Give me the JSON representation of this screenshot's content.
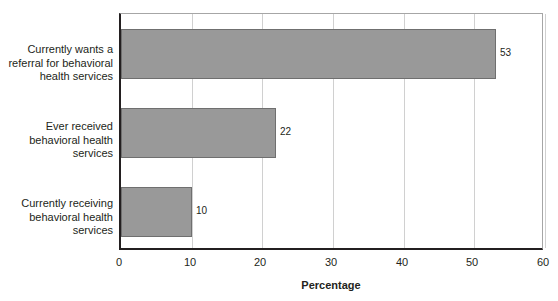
{
  "chart_data": {
    "type": "bar",
    "orientation": "horizontal",
    "title": "",
    "subtitle": "",
    "xlabel": "Percentage",
    "ylabel": "",
    "xlim": [
      0,
      60
    ],
    "xticks": [
      0,
      10,
      20,
      30,
      40,
      50,
      60
    ],
    "xtick_labels": [
      "0",
      "10",
      "20",
      "30",
      "40",
      "50",
      "60"
    ],
    "grid": "vertical",
    "legend": "none",
    "categories": [
      "Currently wants a referral for behavioral health services",
      "Ever received behavioral health services",
      "Currently receiving behavioral health services"
    ],
    "category_label_lines": [
      [
        "Currently wants a",
        "referral for behavioral",
        "health services"
      ],
      [
        "Ever received",
        "behavioral health",
        "services"
      ],
      [
        "Currently receiving",
        "behavioral health",
        "services"
      ]
    ],
    "values": [
      53,
      22,
      10
    ],
    "value_labels": [
      "53",
      "22",
      "10"
    ],
    "colors": {
      "bar_fill": "#999999",
      "bar_edge": "#6f6f6f",
      "axis": "#231f20",
      "grid": "#d0d0d0",
      "plot_border": "#a6a6a6",
      "background": "#ffffff",
      "text": "#231f20"
    }
  }
}
